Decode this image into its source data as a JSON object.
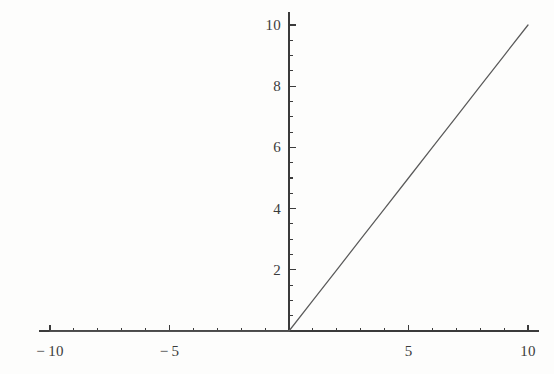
{
  "figure": {
    "width": 554,
    "height": 374,
    "background_color": "#fdfdfc",
    "axis_color": "#3b3b3b",
    "curve_color": "#5a5a5a",
    "label_color": "#3b3b3b"
  },
  "chart_data": {
    "type": "line",
    "title": "",
    "subtitle": "",
    "xlabel": "",
    "ylabel": "",
    "xlim": [
      -10.45,
      10.45
    ],
    "ylim": [
      0,
      10.2
    ],
    "grid": false,
    "legend": null,
    "axes_style": "centered-cross",
    "x_tick_labels": [
      "-10",
      "-5",
      "5",
      "10"
    ],
    "x_tick_values": [
      -10,
      -5,
      5,
      10
    ],
    "x_minor_tick_values": [
      -9,
      -8,
      -7,
      -6,
      -4,
      -3,
      -2,
      -1,
      1,
      2,
      3,
      4,
      6,
      7,
      8,
      9
    ],
    "y_tick_labels": [
      "2",
      "4",
      "6",
      "8",
      "10"
    ],
    "y_tick_values": [
      2,
      4,
      6,
      8,
      10
    ],
    "y_minor_tick_values": [
      0.5,
      1,
      1.5,
      2.5,
      3,
      3.5,
      4.5,
      5,
      5.5,
      6.5,
      7,
      7.5,
      8.5,
      9,
      9.5
    ],
    "series": [
      {
        "name": "Max[0, x]",
        "x": [
          -10,
          -9,
          -8,
          -7,
          -6,
          -5,
          -4,
          -3,
          -2,
          -1,
          0,
          1,
          2,
          3,
          4,
          5,
          6,
          7,
          8,
          9,
          10
        ],
        "values": [
          0,
          0,
          0,
          0,
          0,
          0,
          0,
          0,
          0,
          0,
          0,
          1,
          2,
          3,
          4,
          5,
          6,
          7,
          8,
          9,
          10
        ]
      }
    ],
    "annotations": []
  },
  "labels": {
    "x": [
      {
        "text": "-10",
        "value": -10
      },
      {
        "text": "-5",
        "value": -5
      },
      {
        "text": "5",
        "value": 5
      },
      {
        "text": "10",
        "value": 10
      }
    ],
    "y": [
      {
        "text": "2",
        "value": 2
      },
      {
        "text": "4",
        "value": 4
      },
      {
        "text": "6",
        "value": 6
      },
      {
        "text": "8",
        "value": 8
      },
      {
        "text": "10",
        "value": 10
      }
    ]
  }
}
